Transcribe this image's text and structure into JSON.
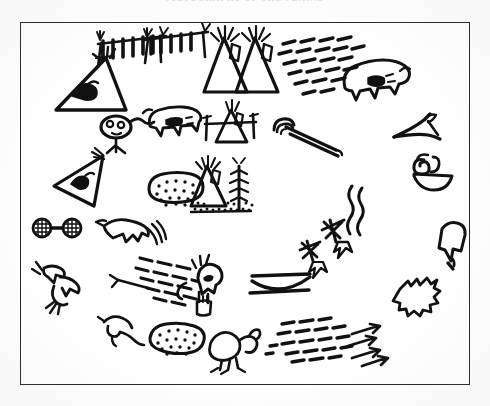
{
  "plate": {
    "caption": "PICTOGRAPHS OF THE PLAINS",
    "frame_color": "#23232a",
    "ink_color": "#111111",
    "paper_color": "#ffffff",
    "layout": "oval ring of pictographic glyphs inside a thin rectangular border",
    "width": 490,
    "height": 406
  },
  "glyphs": [
    {
      "id": "tipi-with-bird-emblem",
      "label": "tipi with bird emblem",
      "x": 72,
      "y": 86,
      "size": 62
    },
    {
      "id": "drying-rack-left",
      "label": "drying rack with hides",
      "x": 128,
      "y": 52,
      "size": 58
    },
    {
      "id": "drying-rack-right",
      "label": "drying rack with hides",
      "x": 178,
      "y": 50,
      "size": 58
    },
    {
      "id": "tipi-plain-left",
      "label": "tipi with smoke poles",
      "x": 224,
      "y": 62,
      "size": 56
    },
    {
      "id": "tipi-plain-right",
      "label": "tipi with smoke poles",
      "x": 254,
      "y": 64,
      "size": 56
    },
    {
      "id": "dash-field-top",
      "label": "field of tally dashes",
      "x": 306,
      "y": 62,
      "size": 74
    },
    {
      "id": "bison",
      "label": "bison",
      "x": 375,
      "y": 84,
      "size": 62
    },
    {
      "id": "masked-head",
      "label": "masked head figure",
      "x": 118,
      "y": 126,
      "size": 44
    },
    {
      "id": "bear",
      "label": "bear",
      "x": 172,
      "y": 120,
      "size": 50
    },
    {
      "id": "tipi-on-rack",
      "label": "tipi on horizontal rack",
      "x": 231,
      "y": 124,
      "size": 50
    },
    {
      "id": "pipe",
      "label": "ceremonial pipe",
      "x": 302,
      "y": 128,
      "size": 62
    },
    {
      "id": "crossed-poles",
      "label": "crossed poles",
      "x": 419,
      "y": 128,
      "size": 48
    },
    {
      "id": "tipi-with-fish-emblem",
      "label": "tipi with fish emblem",
      "x": 74,
      "y": 178,
      "size": 56
    },
    {
      "id": "dotted-hide-upper",
      "label": "dotted hide or berry patch",
      "x": 169,
      "y": 192,
      "size": 48
    },
    {
      "id": "tipi-with-tree",
      "label": "tipi beside tree",
      "x": 217,
      "y": 190,
      "size": 62
    },
    {
      "id": "spiral-and-bowl",
      "label": "spiral shell and bowl",
      "x": 424,
      "y": 166,
      "size": 44
    },
    {
      "id": "dumbbell",
      "label": "paired hatched discs",
      "x": 46,
      "y": 227,
      "size": 42
    },
    {
      "id": "bird-with-plumes",
      "label": "bird with plumes",
      "x": 126,
      "y": 226,
      "size": 50
    },
    {
      "id": "wavy-smoke",
      "label": "wavy smoke lines",
      "x": 341,
      "y": 220,
      "size": 46
    },
    {
      "id": "pouch",
      "label": "hanging pouch",
      "x": 456,
      "y": 239,
      "size": 38
    },
    {
      "id": "starbursts",
      "label": "starburst marks",
      "x": 338,
      "y": 254,
      "size": 46
    },
    {
      "id": "dash-field-mid",
      "label": "field of tally dashes",
      "x": 170,
      "y": 266,
      "size": 56
    },
    {
      "id": "human-figure",
      "label": "standing human figure",
      "x": 208,
      "y": 285,
      "size": 50
    },
    {
      "id": "bow-curve",
      "label": "bow or canoe curve",
      "x": 276,
      "y": 283,
      "size": 54
    },
    {
      "id": "hide-square",
      "label": "stretched hide",
      "x": 419,
      "y": 292,
      "size": 38
    },
    {
      "id": "arrow-figure",
      "label": "feathered arrow and animal",
      "x": 64,
      "y": 288,
      "size": 52
    },
    {
      "id": "crouching-animal",
      "label": "crouching animal",
      "x": 120,
      "y": 328,
      "size": 40
    },
    {
      "id": "dotted-hide-lower",
      "label": "dotted hide or berry patch",
      "x": 174,
      "y": 343,
      "size": 48
    },
    {
      "id": "antlered-animal",
      "label": "antlered animal",
      "x": 232,
      "y": 348,
      "size": 46
    },
    {
      "id": "dash-arrow-field",
      "label": "dashes with arrows",
      "x": 324,
      "y": 338,
      "size": 84
    }
  ]
}
